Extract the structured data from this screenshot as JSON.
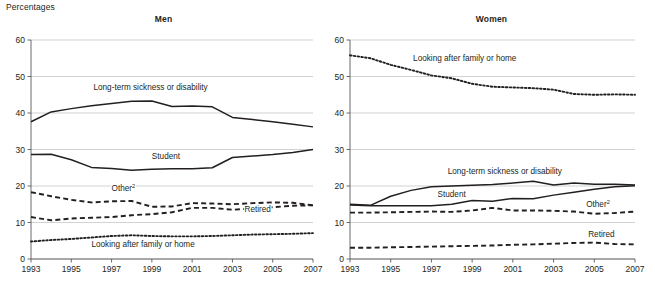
{
  "units_label": "Percentages",
  "panels": [
    {
      "key": "men",
      "title": "Men"
    },
    {
      "key": "women",
      "title": "Women"
    }
  ],
  "chart_data": [
    {
      "type": "line",
      "title": "Men",
      "subtitle": "",
      "xlabel": "",
      "ylabel": "Percentages",
      "ylim": [
        0,
        60
      ],
      "yticks": [
        0,
        10,
        20,
        30,
        40,
        50,
        60
      ],
      "xlim": [
        1993,
        2007
      ],
      "x": [
        1993,
        1994,
        1995,
        1996,
        1997,
        1998,
        1999,
        2000,
        2001,
        2002,
        2003,
        2004,
        2005,
        2006,
        2007
      ],
      "xticks": [
        1993,
        1995,
        1997,
        1999,
        2001,
        2003,
        2005,
        2007
      ],
      "grid": true,
      "legend_position": "inline-labels",
      "series": [
        {
          "name": "Long-term sickness or disability",
          "style": "solid",
          "label_x": 1996.1,
          "label_y": 46.2,
          "values": [
            37.6,
            40.3,
            41.2,
            42.0,
            42.6,
            43.2,
            43.3,
            41.8,
            41.9,
            41.7,
            38.8,
            38.2,
            37.6,
            36.9,
            36.2
          ]
        },
        {
          "name": "Student",
          "style": "solid",
          "label_x": 1999.0,
          "label_y": 27.3,
          "values": [
            28.6,
            28.7,
            27.2,
            25.1,
            24.8,
            24.3,
            24.6,
            24.7,
            24.7,
            25.0,
            27.8,
            28.2,
            28.6,
            29.2,
            30.0
          ]
        },
        {
          "name": "Other",
          "superscript": "2",
          "style": "dashed",
          "label_x": 1997.0,
          "label_y": 18.6,
          "values": [
            18.3,
            17.2,
            16.2,
            15.5,
            15.8,
            15.9,
            14.3,
            14.4,
            15.3,
            15.2,
            15.0,
            15.3,
            15.5,
            15.4,
            14.7
          ]
        },
        {
          "name": "Retired",
          "style": "dashed",
          "label_x": 2003.6,
          "label_y": 13.0,
          "values": [
            11.5,
            10.6,
            11.1,
            11.3,
            11.5,
            12.0,
            12.3,
            12.8,
            14.0,
            14.0,
            13.5,
            13.8,
            14.2,
            14.6,
            14.7
          ]
        },
        {
          "name": "Looking after family or home",
          "style": "dotted",
          "label_x": 1996.0,
          "label_y": 3.2,
          "values": [
            4.8,
            5.2,
            5.5,
            5.9,
            6.3,
            6.5,
            6.3,
            6.2,
            6.2,
            6.3,
            6.5,
            6.7,
            6.8,
            6.9,
            7.1
          ]
        }
      ]
    },
    {
      "type": "line",
      "title": "Women",
      "subtitle": "",
      "xlabel": "",
      "ylabel": "Percentages",
      "ylim": [
        0,
        60
      ],
      "yticks": [
        0,
        10,
        20,
        30,
        40,
        50,
        60
      ],
      "xlim": [
        1993,
        2007
      ],
      "x": [
        1993,
        1994,
        1995,
        1996,
        1997,
        1998,
        1999,
        2000,
        2001,
        2002,
        2003,
        2004,
        2005,
        2006,
        2007
      ],
      "xticks": [
        1993,
        1995,
        1997,
        1999,
        2001,
        2003,
        2005,
        2007
      ],
      "grid": true,
      "legend_position": "inline-labels",
      "series": [
        {
          "name": "Looking after family or home",
          "style": "dotted",
          "label_x": 1996.1,
          "label_y": 54.2,
          "values": [
            55.8,
            55.0,
            53.2,
            51.8,
            50.3,
            49.5,
            48.0,
            47.2,
            47.0,
            46.8,
            46.4,
            45.2,
            45.0,
            45.1,
            45.0
          ]
        },
        {
          "name": "Long-term sickness or disability",
          "style": "solid",
          "label_x": 1997.8,
          "label_y": 23.4,
          "values": [
            15.0,
            14.7,
            17.2,
            18.8,
            19.8,
            20.0,
            20.2,
            20.4,
            20.8,
            21.3,
            20.3,
            20.8,
            20.5,
            20.5,
            20.3
          ]
        },
        {
          "name": "Student",
          "style": "solid",
          "label_x": 1997.3,
          "label_y": 17.0,
          "values": [
            14.8,
            14.6,
            14.6,
            14.6,
            14.6,
            15.0,
            16.0,
            15.8,
            16.6,
            16.5,
            17.5,
            18.3,
            19.1,
            19.8,
            20.1
          ]
        },
        {
          "name": "Other",
          "superscript": "2",
          "style": "dashed",
          "label_x": 2004.6,
          "label_y": 14.3,
          "values": [
            12.7,
            12.7,
            12.8,
            12.9,
            13.0,
            12.9,
            13.3,
            14.0,
            13.3,
            13.3,
            13.2,
            13.0,
            12.4,
            12.6,
            13.0
          ]
        },
        {
          "name": "Retired",
          "style": "dashed",
          "label_x": 2004.7,
          "label_y": 6.1,
          "values": [
            3.1,
            3.1,
            3.2,
            3.3,
            3.4,
            3.5,
            3.6,
            3.7,
            3.9,
            4.0,
            4.2,
            4.4,
            4.5,
            4.1,
            4.0
          ]
        }
      ]
    }
  ]
}
